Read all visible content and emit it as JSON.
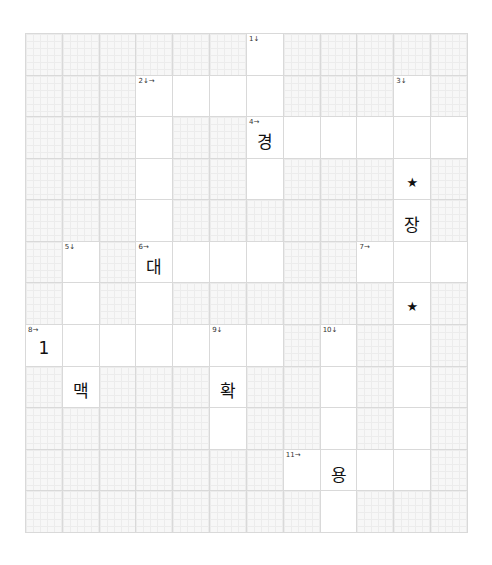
{
  "puzzle": {
    "rows": 12,
    "cols": 12,
    "colors": {
      "grid_line": "#d9d9d9",
      "blocked_fill": "#f7f7f7",
      "open_fill": "#ffffff",
      "text": "#111111"
    },
    "open_cells": [
      [
        0,
        6
      ],
      [
        1,
        3
      ],
      [
        1,
        4
      ],
      [
        1,
        5
      ],
      [
        1,
        6
      ],
      [
        1,
        10
      ],
      [
        2,
        3
      ],
      [
        2,
        6
      ],
      [
        2,
        7
      ],
      [
        2,
        8
      ],
      [
        2,
        9
      ],
      [
        2,
        10
      ],
      [
        2,
        11
      ],
      [
        3,
        3
      ],
      [
        3,
        6
      ],
      [
        3,
        10
      ],
      [
        4,
        3
      ],
      [
        4,
        10
      ],
      [
        5,
        1
      ],
      [
        5,
        3
      ],
      [
        5,
        4
      ],
      [
        5,
        5
      ],
      [
        5,
        6
      ],
      [
        5,
        9
      ],
      [
        5,
        10
      ],
      [
        5,
        11
      ],
      [
        6,
        1
      ],
      [
        6,
        3
      ],
      [
        6,
        10
      ],
      [
        7,
        0
      ],
      [
        7,
        1
      ],
      [
        7,
        2
      ],
      [
        7,
        3
      ],
      [
        7,
        4
      ],
      [
        7,
        5
      ],
      [
        7,
        6
      ],
      [
        7,
        8
      ],
      [
        7,
        10
      ],
      [
        8,
        1
      ],
      [
        8,
        5
      ],
      [
        8,
        8
      ],
      [
        8,
        10
      ],
      [
        9,
        5
      ],
      [
        9,
        8
      ],
      [
        9,
        10
      ],
      [
        10,
        7
      ],
      [
        10,
        8
      ],
      [
        10,
        9
      ],
      [
        10,
        10
      ],
      [
        11,
        8
      ]
    ],
    "clue_numbers": [
      {
        "row": 0,
        "col": 6,
        "label": "1↓"
      },
      {
        "row": 1,
        "col": 3,
        "label": "2↓→"
      },
      {
        "row": 1,
        "col": 10,
        "label": "3↓"
      },
      {
        "row": 2,
        "col": 6,
        "label": "4→"
      },
      {
        "row": 5,
        "col": 1,
        "label": "5↓"
      },
      {
        "row": 5,
        "col": 3,
        "label": "6→"
      },
      {
        "row": 5,
        "col": 9,
        "label": "7→"
      },
      {
        "row": 7,
        "col": 0,
        "label": "8→"
      },
      {
        "row": 7,
        "col": 5,
        "label": "9↓"
      },
      {
        "row": 7,
        "col": 8,
        "label": "10↓"
      },
      {
        "row": 10,
        "col": 7,
        "label": "11→"
      }
    ],
    "letters": [
      {
        "row": 2,
        "col": 6,
        "value": "경"
      },
      {
        "row": 3,
        "col": 10,
        "value": "★",
        "star": true
      },
      {
        "row": 4,
        "col": 10,
        "value": "장"
      },
      {
        "row": 5,
        "col": 3,
        "value": "대"
      },
      {
        "row": 6,
        "col": 10,
        "value": "★",
        "star": true
      },
      {
        "row": 7,
        "col": 0,
        "value": "1"
      },
      {
        "row": 8,
        "col": 1,
        "value": "맥"
      },
      {
        "row": 8,
        "col": 5,
        "value": "확"
      },
      {
        "row": 10,
        "col": 8,
        "value": "용"
      }
    ]
  }
}
